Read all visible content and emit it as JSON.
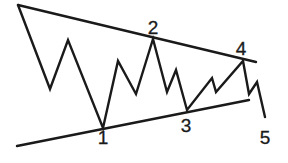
{
  "diagram": {
    "type": "symmetrical-triangle-wave-pattern",
    "stroke_color": "#1a1a1a",
    "background": "#ffffff",
    "upper_trendline": {
      "x1": 18,
      "y1": 5,
      "x2": 256,
      "y2": 62
    },
    "lower_trendline": {
      "x1": 17,
      "y1": 146,
      "x2": 249,
      "y2": 100
    },
    "wave_path": [
      [
        18,
        5
      ],
      [
        50,
        89
      ],
      [
        68,
        40
      ],
      [
        103,
        128
      ],
      [
        118,
        61
      ],
      [
        136,
        94
      ],
      [
        153,
        39
      ],
      [
        167,
        92
      ],
      [
        176,
        70
      ],
      [
        187,
        110
      ],
      [
        212,
        78
      ],
      [
        216,
        92
      ],
      [
        243,
        61
      ],
      [
        249,
        94
      ],
      [
        257,
        82
      ],
      [
        265,
        117
      ]
    ],
    "labels": [
      {
        "text": "1",
        "x": 103,
        "y": 128
      },
      {
        "text": "2",
        "x": 153,
        "y": 18
      },
      {
        "text": "3",
        "x": 186,
        "y": 116
      },
      {
        "text": "4",
        "x": 241,
        "y": 39
      },
      {
        "text": "5",
        "x": 265,
        "y": 128
      }
    ]
  }
}
